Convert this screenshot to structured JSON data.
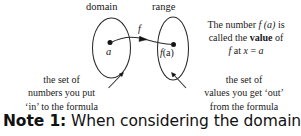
{
  "figure": {
    "sets": {
      "domain_label": "domain",
      "range_label": "range"
    },
    "elements": {
      "domain_element": "a",
      "range_element_f": "f",
      "range_element_arg": "(a)"
    },
    "mapping_label": "f"
  },
  "callouts": {
    "value_note": {
      "line1_prefix": "The number ",
      "line1_f": "f",
      "line1_arg": " (a)",
      "line1_suffix": " is",
      "line2_prefix": "called the ",
      "line2_bold": "value",
      "line2_suffix": " of",
      "line3_f": "f",
      "line3_rest": " at ",
      "line3_x": "x",
      "line3_eq": " = ",
      "line3_a": "a"
    },
    "domain_desc": {
      "line1": "the set of",
      "line2": "numbers you put",
      "line3": "‘in’ to the formula"
    },
    "range_desc": {
      "line1": "the set of",
      "line2": "values you get ‘out’",
      "line3": "from the formula"
    }
  },
  "note": {
    "label": "Note 1:",
    "text": " When considering the domain of a"
  },
  "colors": {
    "ink": "#161616",
    "stroke": "#2a2a2a",
    "background": "#ffffff"
  }
}
